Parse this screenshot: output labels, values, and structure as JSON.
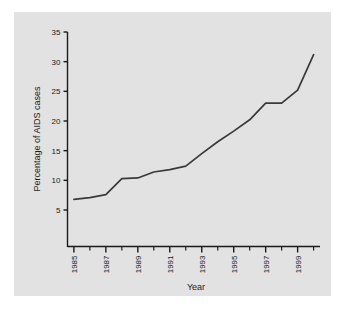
{
  "figure": {
    "background_color": "#ffffff",
    "panel_color": "#e2e2e2",
    "line_color": "#3a3a3a",
    "axis_color": "#1a1a1a"
  },
  "chart_data": {
    "type": "line",
    "title": "",
    "xlabel": "Year",
    "ylabel": "Percentage of AIDS cases",
    "x": [
      1985,
      1986,
      1987,
      1988,
      1989,
      1990,
      1991,
      1992,
      1993,
      1994,
      1995,
      1996,
      1997,
      1998,
      1999,
      2000
    ],
    "values": [
      6.8,
      7.1,
      7.6,
      10.3,
      10.4,
      11.4,
      11.8,
      12.4,
      14.5,
      16.5,
      18.3,
      20.2,
      23.0,
      23.0,
      25.2,
      31.2
    ],
    "series": [
      {
        "name": "Percentage of AIDS cases",
        "values": [
          6.8,
          7.1,
          7.6,
          10.3,
          10.4,
          11.4,
          11.8,
          12.4,
          14.5,
          16.5,
          18.3,
          20.2,
          23.0,
          23.0,
          25.2,
          31.2
        ]
      }
    ],
    "xlim": [
      1984.6,
      2000.4
    ],
    "ylim": [
      0,
      36
    ],
    "ytick_values": [
      5,
      10,
      15,
      20,
      25,
      30,
      35
    ],
    "ytick_labels": [
      "5",
      "10",
      "15",
      "20",
      "25",
      "30",
      "35"
    ],
    "xtick_major_values": [
      1985,
      1987,
      1989,
      1991,
      1993,
      1995,
      1997,
      1999
    ],
    "xtick_major_labels": [
      "1985",
      "1987",
      "1989",
      "1991",
      "1993",
      "1995",
      "1997",
      "1999"
    ],
    "xtick_minor_values": [
      1986,
      1988,
      1990,
      1992,
      1994,
      1996,
      1998,
      2000
    ],
    "xtick_label_rotation": "90",
    "grid": "off",
    "legend": "none",
    "markers": "none"
  },
  "axis": {
    "y_label": "Percentage of AIDS cases",
    "x_label": "Year",
    "y_ticks": [
      "35",
      "30",
      "25",
      "20",
      "15",
      "10",
      "5"
    ],
    "x_ticks": [
      "1985",
      "1987",
      "1989",
      "1991",
      "1993",
      "1995",
      "1997",
      "1999"
    ]
  }
}
